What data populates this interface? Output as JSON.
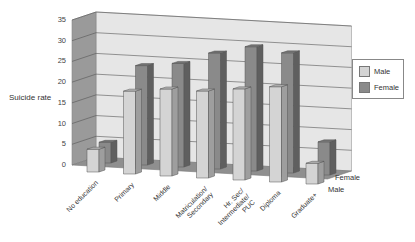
{
  "chart_data": {
    "type": "bar",
    "subtype": "3d-clustered-depth",
    "title": "",
    "xlabel": "",
    "ylabel": "Suicide rate",
    "ylim": [
      0,
      35
    ],
    "yticks": [
      "0",
      "5",
      "10",
      "15",
      "20",
      "25",
      "30",
      "35"
    ],
    "grid": true,
    "legend_position": "right",
    "categories": [
      "No education",
      "Primary",
      "Middle",
      "Matriculation/\nSecondary",
      "Hr. Sec/\nIntermediate/\nPUC",
      "Diploma",
      "Graduate+"
    ],
    "series": [
      {
        "name": "Male",
        "color": "#d4d4d4",
        "values": [
          5.5,
          20,
          21,
          21,
          22,
          23,
          5
        ]
      },
      {
        "name": "Female",
        "color": "#8a8a8a",
        "values": [
          5,
          24,
          25,
          28,
          30,
          29,
          8
        ]
      }
    ],
    "depth_labels": [
      "Female",
      "Male"
    ]
  },
  "legend": {
    "items": [
      {
        "label": "Male",
        "color": "#d4d4d4"
      },
      {
        "label": "Female",
        "color": "#8a8a8a"
      }
    ]
  }
}
